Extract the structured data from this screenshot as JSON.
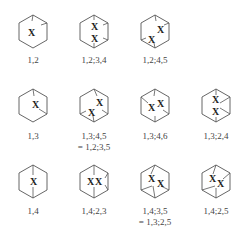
{
  "figure": {
    "header_cut_text": "",
    "diagrams": [
      {
        "id": "d1",
        "label": "1,2",
        "label2": ""
      },
      {
        "id": "d2",
        "label": "1,2;3,4",
        "label2": ""
      },
      {
        "id": "d3",
        "label": "1,2;4,5",
        "label2": ""
      },
      {
        "id": "d4",
        "label": "1,3",
        "label2": ""
      },
      {
        "id": "d5",
        "label": "1,3;4,5",
        "label2": "= 1,2;3,5"
      },
      {
        "id": "d6",
        "label": "1,3;4,6",
        "label2": ""
      },
      {
        "id": "d7",
        "label": "1,3;2,4",
        "label2": ""
      },
      {
        "id": "d8",
        "label": "1,4",
        "label2": ""
      },
      {
        "id": "d9",
        "label": "1,4;2,3",
        "label2": ""
      },
      {
        "id": "d10",
        "label": "1,4;3,5",
        "label2": "= 1,3;2,5"
      },
      {
        "id": "d11",
        "label": "1,4;2,5",
        "label2": ""
      }
    ],
    "marker_symbol": "X",
    "colors": {
      "line": "#555555",
      "text": "#444444",
      "background": "#ffffff"
    }
  }
}
